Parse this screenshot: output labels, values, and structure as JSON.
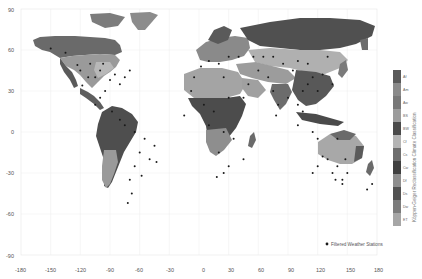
{
  "chart_data": {
    "type": "map",
    "title": "",
    "xlabel": "",
    "ylabel": "",
    "xlim": [
      -180,
      180
    ],
    "ylim": [
      -90,
      90
    ],
    "x_ticks": [
      "-180",
      "-150",
      "-120",
      "-90",
      "-60",
      "-30",
      "0",
      "30",
      "60",
      "90",
      "120",
      "150",
      "180"
    ],
    "y_ticks": [
      "90",
      "60",
      "30",
      "0",
      "-30",
      "-60",
      "-90"
    ],
    "grid": true,
    "colorbar": {
      "title": "Köppen-Geiger Reclassification Climate Classification",
      "classes": [
        "Af",
        "Am",
        "Aw",
        "BS",
        "BW",
        "Cf",
        "Cs",
        "Cw",
        "Df",
        "Ds",
        "Dw",
        "ET"
      ],
      "colors": [
        "#5a5a5a",
        "#8a8a8a",
        "#787878",
        "#9c9c9c",
        "#4a4a4a",
        "#b4b4b4",
        "#6e6e6e",
        "#404040",
        "#8e8e8e",
        "#525252",
        "#7c7c7c",
        "#a6a6a6"
      ]
    },
    "legend": [
      {
        "label": "Filtered Weather Stations",
        "marker": "circle",
        "color": "#1a1a1a"
      }
    ],
    "legend_position": "lower right",
    "series": [
      {
        "name": "Filtered Weather Stations",
        "type": "scatter",
        "note": "approx. station locations (lon, lat)",
        "points": [
          [
            -150,
            61
          ],
          [
            -135,
            58
          ],
          [
            -123,
            49
          ],
          [
            -118,
            34
          ],
          [
            -112,
            40
          ],
          [
            -105,
            40
          ],
          [
            -100,
            45
          ],
          [
            -95,
            30
          ],
          [
            -90,
            38
          ],
          [
            -85,
            42
          ],
          [
            -80,
            35
          ],
          [
            -75,
            40
          ],
          [
            -70,
            45
          ],
          [
            -97,
            50
          ],
          [
            -110,
            50
          ],
          [
            -120,
            45
          ],
          [
            -105,
            20
          ],
          [
            -100,
            25
          ],
          [
            -88,
            15
          ],
          [
            -80,
            9
          ],
          [
            -75,
            5
          ],
          [
            -65,
            0
          ],
          [
            -55,
            -5
          ],
          [
            -45,
            -10
          ],
          [
            -60,
            -15
          ],
          [
            -50,
            -20
          ],
          [
            -65,
            -25
          ],
          [
            -58,
            -32
          ],
          [
            -70,
            -35
          ],
          [
            -68,
            -45
          ],
          [
            -72,
            -52
          ],
          [
            -43,
            -22
          ],
          [
            -5,
            40
          ],
          [
            2,
            48
          ],
          [
            10,
            52
          ],
          [
            20,
            50
          ],
          [
            30,
            55
          ],
          [
            40,
            55
          ],
          [
            25,
            40
          ],
          [
            -8,
            30
          ],
          [
            5,
            20
          ],
          [
            15,
            15
          ],
          [
            30,
            25
          ],
          [
            10,
            5
          ],
          [
            25,
            0
          ],
          [
            35,
            -5
          ],
          [
            20,
            -15
          ],
          [
            30,
            -25
          ],
          [
            25,
            -30
          ],
          [
            18,
            -33
          ],
          [
            45,
            -20
          ],
          [
            -15,
            12
          ],
          [
            45,
            25
          ],
          [
            50,
            35
          ],
          [
            60,
            45
          ],
          [
            70,
            40
          ],
          [
            75,
            30
          ],
          [
            80,
            20
          ],
          [
            78,
            12
          ],
          [
            90,
            25
          ],
          [
            100,
            20
          ],
          [
            105,
            30
          ],
          [
            110,
            35
          ],
          [
            115,
            40
          ],
          [
            120,
            30
          ],
          [
            125,
            42
          ],
          [
            135,
            35
          ],
          [
            85,
            50
          ],
          [
            100,
            52
          ],
          [
            110,
            50
          ],
          [
            130,
            55
          ],
          [
            55,
            55
          ],
          [
            65,
            55
          ],
          [
            75,
            55
          ],
          [
            95,
            45
          ],
          [
            105,
            15
          ],
          [
            100,
            5
          ],
          [
            115,
            0
          ],
          [
            120,
            -5
          ],
          [
            140,
            -5
          ],
          [
            115,
            -30
          ],
          [
            120,
            -25
          ],
          [
            130,
            -20
          ],
          [
            135,
            -30
          ],
          [
            140,
            -25
          ],
          [
            145,
            -35
          ],
          [
            150,
            -30
          ],
          [
            148,
            -20
          ],
          [
            138,
            -35
          ],
          [
            125,
            -18
          ],
          [
            145,
            -38
          ],
          [
            170,
            -42
          ],
          [
            175,
            -38
          ]
        ]
      }
    ]
  },
  "labels": {
    "x0": "-180",
    "x1": "-150",
    "x2": "-120",
    "x3": "-90",
    "x4": "-60",
    "x5": "-30",
    "x6": "0",
    "x7": "30",
    "x8": "60",
    "x9": "90",
    "x10": "120",
    "x11": "150",
    "x12": "180",
    "y0": "90",
    "y1": "60",
    "y2": "30",
    "y3": "0",
    "y4": "-30",
    "y5": "-60",
    "y6": "-90",
    "cb_title": "Köppen-Geiger Reclassification Climate Classification",
    "cb0": "Af",
    "cb1": "Am",
    "cb2": "Aw",
    "cb3": "BS",
    "cb4": "BW",
    "cb5": "Cf",
    "cb6": "Cs",
    "cb7": "Cw",
    "cb8": "Df",
    "cb9": "Ds",
    "cb10": "Dw",
    "cb11": "ET",
    "legend": "Filtered Weather Stations"
  }
}
